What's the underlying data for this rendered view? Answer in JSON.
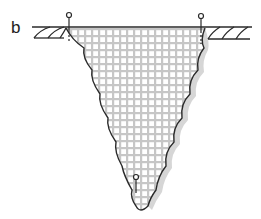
{
  "figure": {
    "panel_label": "b",
    "colors": {
      "outline": "#2a2a2a",
      "grid": "#b8b8b8",
      "shadow": "#d0d0d0"
    }
  }
}
